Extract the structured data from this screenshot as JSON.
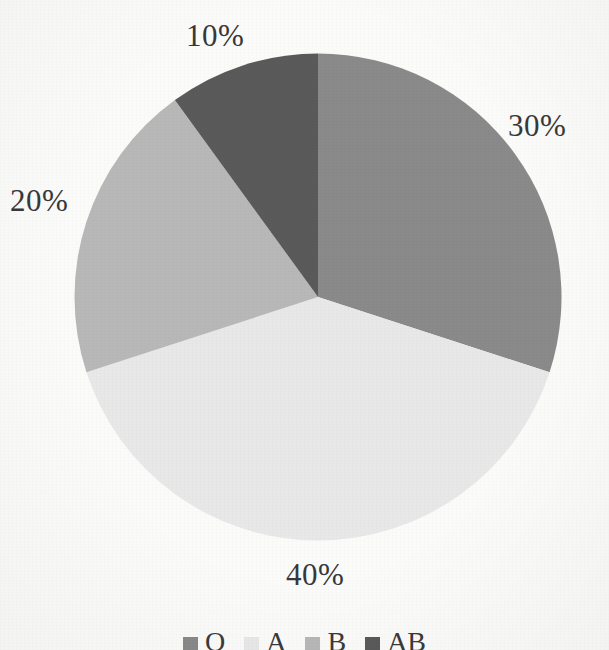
{
  "chart_data": {
    "type": "pie",
    "title": "",
    "categories": [
      "O",
      "A",
      "B",
      "AB"
    ],
    "values": [
      30,
      40,
      20,
      10
    ],
    "value_unit": "%",
    "data_labels": [
      "30%",
      "40%",
      "20%",
      "10%"
    ],
    "legend": {
      "position": "bottom",
      "entries": [
        {
          "label": "O",
          "color": "#8a8a8a"
        },
        {
          "label": "A",
          "color": "#e8e8e8"
        },
        {
          "label": "B",
          "color": "#b8b8b8"
        },
        {
          "label": "AB",
          "color": "#5a5a5a"
        }
      ]
    },
    "slices": [
      {
        "label": "O",
        "value": 30,
        "display": "30%",
        "color": "#8a8a8a",
        "start_angle": 0,
        "end_angle": 108
      },
      {
        "label": "A",
        "value": 40,
        "display": "40%",
        "color": "#e8e8e8",
        "start_angle": 108,
        "end_angle": 252
      },
      {
        "label": "B",
        "value": 20,
        "display": "20%",
        "color": "#b8b8b8",
        "start_angle": 252,
        "end_angle": 324
      },
      {
        "label": "AB",
        "value": 10,
        "display": "10%",
        "color": "#5a5a5a",
        "start_angle": 324,
        "end_angle": 360
      }
    ],
    "start_angle": 0,
    "direction": "clockwise",
    "grid": false,
    "xlabel": "",
    "ylabel": ""
  },
  "labels": {
    "slice_o": "30%",
    "slice_a": "40%",
    "slice_b": "20%",
    "slice_ab": "10%"
  },
  "legend": {
    "o": "O",
    "a": "A",
    "b": "B",
    "ab": "AB"
  },
  "colors": {
    "background": "#fbfbfa",
    "slice_o": "#8a8a8a",
    "slice_a": "#e8e8e8",
    "slice_b": "#b8b8b8",
    "slice_ab": "#5a5a5a",
    "text": "#38383a"
  }
}
